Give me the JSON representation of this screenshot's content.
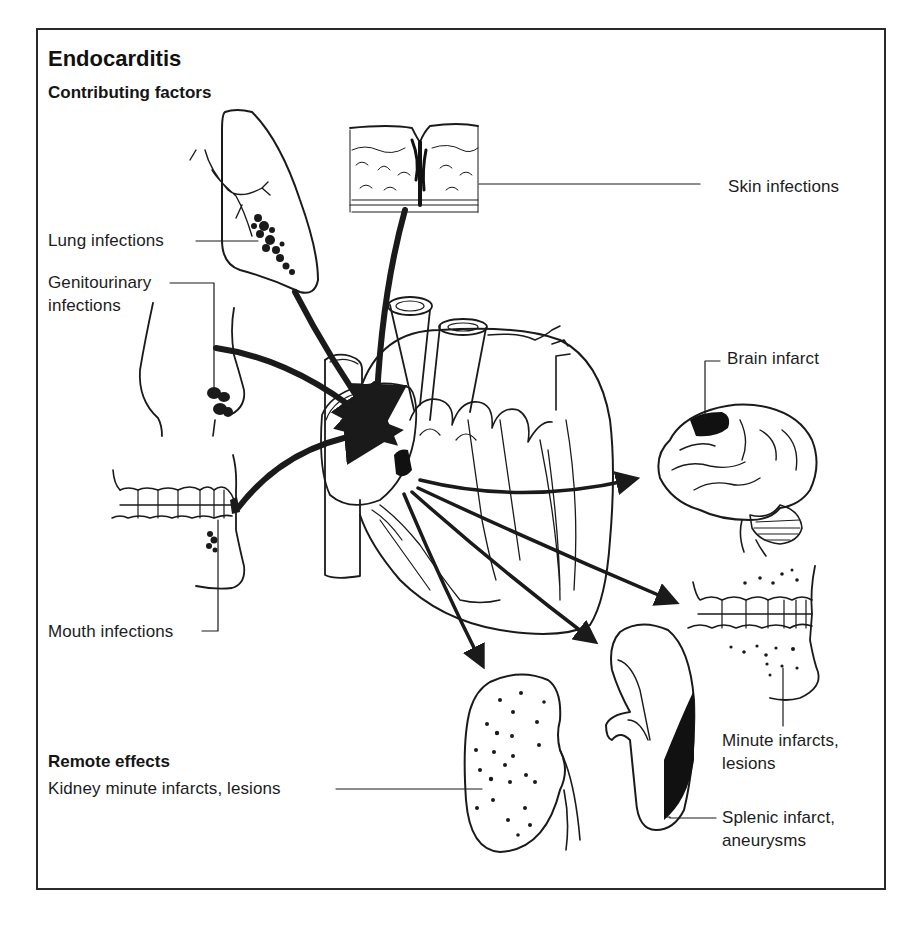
{
  "figure": {
    "title": "Endocarditis",
    "sections": {
      "contributing": "Contributing factors",
      "remote": "Remote effects"
    },
    "contributing_factors": [
      {
        "label": "Skin infections"
      },
      {
        "label": "Lung infections"
      },
      {
        "label_line1": "Genitourinary",
        "label_line2": "infections"
      },
      {
        "label": "Mouth infections"
      }
    ],
    "remote_effects": [
      {
        "label": "Brain infarct"
      },
      {
        "label_line1": "Minute infarcts,",
        "label_line2": "lesions"
      },
      {
        "label_line1": "Splenic infarct,",
        "label_line2": "aneurysms"
      },
      {
        "label": "Kidney minute infarcts, lesions"
      }
    ],
    "center_organ": "heart",
    "colors": {
      "ink": "#1a1a1a",
      "background": "#ffffff",
      "frame": "#2a2a2a"
    }
  }
}
